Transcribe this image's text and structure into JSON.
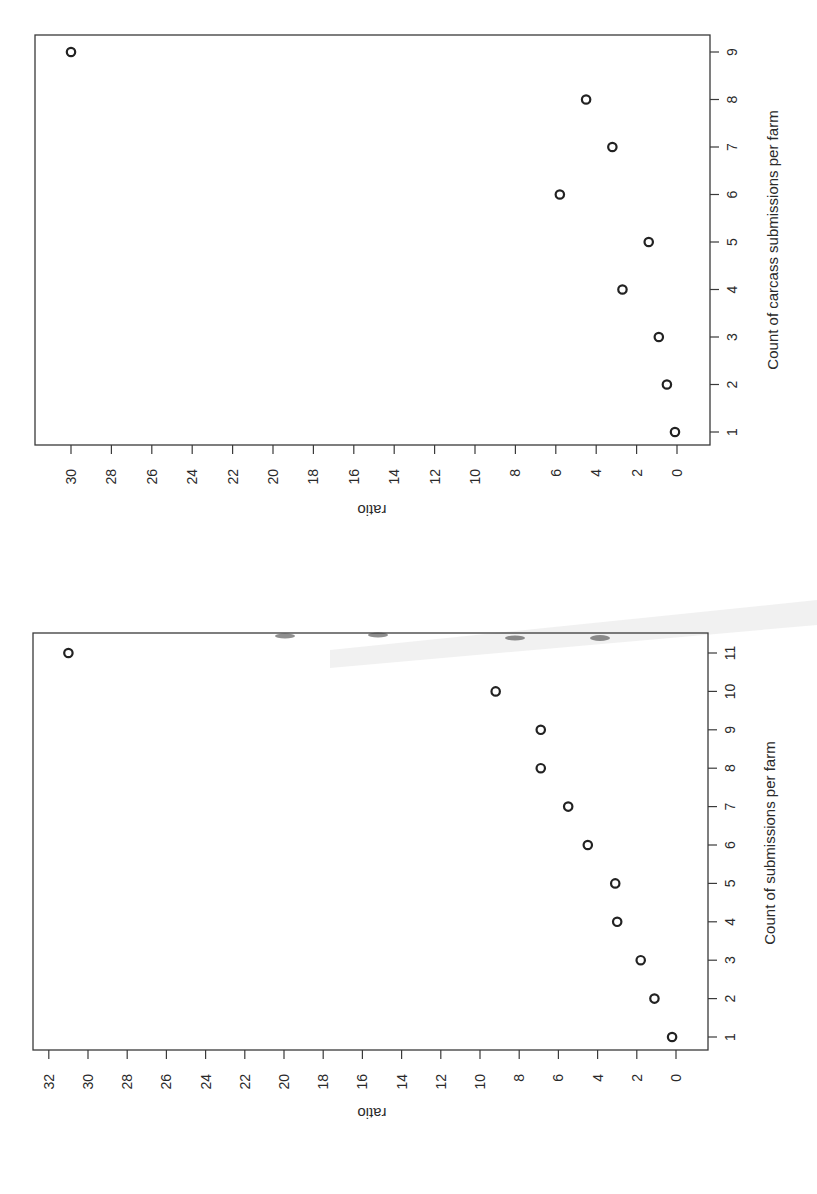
{
  "page": {
    "orientation": "rotated 90 degrees (landscape figure scanned in portrait)"
  },
  "chart_data": [
    {
      "type": "scatter",
      "title": "",
      "xlabel": "Count of carcass submissions per farm",
      "ylabel": "ratio",
      "x": [
        1,
        2,
        3,
        4,
        5,
        6,
        7,
        8,
        9
      ],
      "y": [
        0.1,
        0.5,
        0.9,
        2.7,
        1.4,
        5.8,
        3.2,
        4.5,
        30.0
      ],
      "x_ticks": [
        "1",
        "2",
        "3",
        "4",
        "5",
        "6",
        "7",
        "8",
        "9"
      ],
      "y_ticks": [
        "0",
        "2",
        "4",
        "6",
        "8",
        "10",
        "12",
        "14",
        "16",
        "18",
        "20",
        "22",
        "24",
        "26",
        "28",
        "30"
      ],
      "xlim": [
        0.7,
        9.3
      ],
      "ylim": [
        -1.2,
        32
      ],
      "grid": false,
      "legend": null,
      "marker": "open circle"
    },
    {
      "type": "scatter",
      "title": "",
      "xlabel": "Count of submissions per farm",
      "ylabel": "ratio",
      "x": [
        1,
        2,
        3,
        4,
        5,
        6,
        7,
        8,
        9,
        10,
        11
      ],
      "y": [
        0.2,
        1.1,
        1.8,
        3.0,
        3.1,
        4.5,
        5.5,
        6.9,
        6.9,
        9.2,
        31.0
      ],
      "x_ticks": [
        "1",
        "2",
        "3",
        "4",
        "5",
        "6",
        "7",
        "8",
        "9",
        "10",
        "11"
      ],
      "y_ticks": [
        "0",
        "2",
        "4",
        "6",
        "8",
        "10",
        "12",
        "14",
        "16",
        "18",
        "20",
        "22",
        "24",
        "26",
        "28",
        "30",
        "32"
      ],
      "xlim": [
        0.6,
        11.6
      ],
      "ylim": [
        -1.2,
        32.8
      ],
      "grid": false,
      "legend": null,
      "marker": "open circle"
    }
  ],
  "layout": {
    "panels": [
      {
        "frame": {
          "left": 35,
          "top": 35,
          "right": 710,
          "bottom": 445
        },
        "ratio_zero_px": 677,
        "ratio_px_per_unit": 20.2,
        "count_one_px": 432,
        "count_px_per_unit": -47.5,
        "ylabel_pos": {
          "x": 372,
          "y": 505
        },
        "xlabel_pos": {
          "x": 778,
          "y": 240
        }
      },
      {
        "frame": {
          "left": 33,
          "top": 633,
          "right": 708,
          "bottom": 1050
        },
        "ratio_zero_px": 676,
        "ratio_px_per_unit": 19.6,
        "count_one_px": 1037,
        "count_px_per_unit": -38.4,
        "ylabel_pos": {
          "x": 372,
          "y": 1108
        },
        "xlabel_pos": {
          "x": 775,
          "y": 843
        }
      }
    ]
  }
}
